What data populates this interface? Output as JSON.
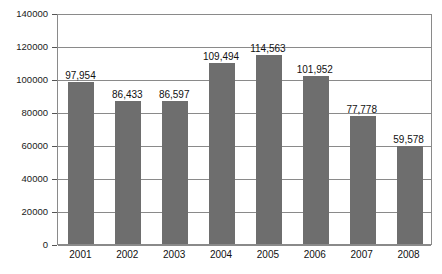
{
  "chart_data": {
    "type": "bar",
    "title": "",
    "xlabel": "",
    "ylabel": "",
    "categories": [
      "2001",
      "2002",
      "2003",
      "2004",
      "2005",
      "2006",
      "2007",
      "2008"
    ],
    "values": [
      97954,
      86433,
      86597,
      109494,
      114563,
      101952,
      77778,
      59578
    ],
    "value_labels": [
      "97,954",
      "86,433",
      "86,597",
      "109,494",
      "114,563",
      "101,952",
      "77,778",
      "59,578"
    ],
    "ylim": [
      0,
      140000
    ],
    "ytick_values": [
      0,
      20000,
      40000,
      60000,
      80000,
      100000,
      120000,
      140000
    ],
    "ytick_labels": [
      "0",
      "20000",
      "40000",
      "60000",
      "80000",
      "100000",
      "120000",
      "140000"
    ],
    "grid": true,
    "legend": false,
    "series": [
      {
        "name": "",
        "values": [
          97954,
          86433,
          86597,
          109494,
          114563,
          101952,
          77778,
          59578
        ]
      }
    ],
    "colors": {
      "bar": "#6e6e6e",
      "grid": "#8a8a8a",
      "axis": "#8a8a8a",
      "text": "#111111",
      "background": "#ffffff"
    }
  }
}
